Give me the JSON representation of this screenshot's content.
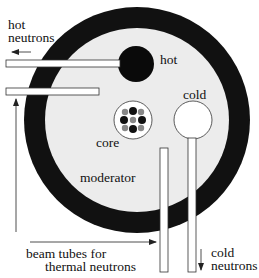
{
  "labels": {
    "hot_neutrons_line1": "hot",
    "hot_neutrons_line2": "neutrons",
    "hot_source": "hot",
    "cold_source": "cold",
    "core": "core",
    "moderator": "moderator",
    "beam_tubes_line1": "beam tubes for",
    "beam_tubes_line2": "thermal neutrons",
    "cold_neutrons_line1": "cold",
    "cold_neutrons_line2": "neutrons"
  },
  "components": {
    "reflector_ring": {
      "color": "#111111"
    },
    "moderator": {
      "color": "#ececec"
    },
    "hot_source": {
      "color": "#0a0a0a"
    },
    "cold_source": {
      "color": "#ffffff"
    },
    "core_elements": [
      {
        "pos": "top-left",
        "color": "#888888"
      },
      {
        "pos": "top-center",
        "color": "#111111"
      },
      {
        "pos": "top-right",
        "color": "#888888"
      },
      {
        "pos": "mid-left",
        "color": "#111111"
      },
      {
        "pos": "center",
        "color": "#888888"
      },
      {
        "pos": "mid-right",
        "color": "#111111"
      },
      {
        "pos": "bottom-left",
        "color": "#888888"
      },
      {
        "pos": "bottom-center",
        "color": "#111111"
      },
      {
        "pos": "bottom-right",
        "color": "#888888"
      }
    ],
    "beam_tubes": [
      {
        "id": "hot-tube",
        "orientation": "horizontal"
      },
      {
        "id": "thermal-tube-horizontal",
        "orientation": "horizontal"
      },
      {
        "id": "thermal-tube-vertical",
        "orientation": "vertical"
      },
      {
        "id": "cold-tube",
        "orientation": "vertical"
      }
    ]
  }
}
